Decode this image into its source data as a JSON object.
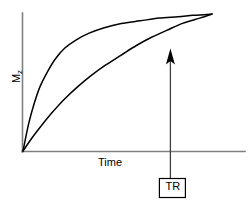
{
  "chart_data": {
    "type": "line",
    "title": "",
    "subtitle": "",
    "xlabel": "Time",
    "ylabel": "Mz",
    "ylabel_base": "M",
    "ylabel_sub": "z",
    "xlim": [
      0,
      1
    ],
    "ylim": [
      0,
      1
    ],
    "grid": false,
    "legend": null,
    "axes_color": "#808080",
    "curve_color": "#000000",
    "marker_color": "#000000",
    "series": [
      {
        "name": "short-T1-recovery",
        "description": "Fast longitudinal magnetization recovery (short T1)",
        "model": "Mz = Mo * (1 - exp(-t/T1)), T1 short",
        "x": [
          0.0,
          0.03,
          0.06,
          0.09,
          0.13,
          0.17,
          0.22,
          0.28,
          0.35,
          0.43,
          0.52,
          0.62,
          0.72,
          0.82,
          0.9,
          0.96,
          1.0
        ],
        "y": [
          0.0,
          0.2,
          0.35,
          0.47,
          0.58,
          0.67,
          0.75,
          0.81,
          0.86,
          0.9,
          0.93,
          0.95,
          0.97,
          0.98,
          0.99,
          0.995,
          1.0
        ]
      },
      {
        "name": "long-T1-recovery",
        "description": "Slow longitudinal magnetization recovery (long T1)",
        "model": "Mz = Mo * (1 - exp(-t/T1)), T1 long",
        "x": [
          0.0,
          0.05,
          0.1,
          0.16,
          0.22,
          0.29,
          0.36,
          0.44,
          0.52,
          0.6,
          0.68,
          0.76,
          0.84,
          0.91,
          0.96,
          1.0
        ],
        "y": [
          0.0,
          0.1,
          0.19,
          0.29,
          0.38,
          0.47,
          0.55,
          0.63,
          0.7,
          0.77,
          0.83,
          0.88,
          0.93,
          0.96,
          0.98,
          1.0
        ]
      }
    ],
    "annotations": [
      {
        "name": "tr-marker",
        "label": "TR",
        "type": "vertical-arrow",
        "x": 0.78,
        "y_from": 0.0,
        "y_to": 0.88,
        "boxed": true
      }
    ]
  },
  "labels": {
    "y_axis": "Mz",
    "y_axis_base": "M",
    "y_axis_sub": "z",
    "x_axis": "Time",
    "tr": "TR"
  }
}
